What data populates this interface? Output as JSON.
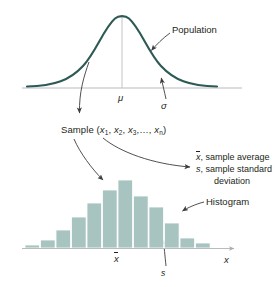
{
  "figure": {
    "title_alt": "Relationship between a population and a sample",
    "colors": {
      "curve": "#2d5a55",
      "bar_fill": "#a8c4c0",
      "bar_stroke": "#ffffff",
      "axis": "#b9bcbd",
      "arrow": "#3c3c3c",
      "text": "#231f20"
    }
  },
  "population": {
    "label": "Population",
    "axis": {
      "x_start": 22,
      "x_end": 242,
      "y": 88
    },
    "mu_label": "μ",
    "sigma_label": "σ",
    "mu_x": 122
  },
  "sample": {
    "text_prefix": "Sample (",
    "x1": "x",
    "x1_sub": "1",
    "x2": "x",
    "x2_sub": "2",
    "x3": "x",
    "x3_sub": "3",
    "ellipsis": ",…,",
    "xn": "x",
    "xn_sub": "n",
    "text_suffix": ")"
  },
  "statistics": {
    "line1_symbol": "x",
    "line1_text": ", sample average",
    "line2_symbol": "s",
    "line2_text": ", sample standard",
    "line3_text": "deviation"
  },
  "histogram": {
    "label": "Histogram",
    "axis_label": "x",
    "xbar_label": "x",
    "s_label": "s",
    "xbar_x": 118,
    "s_x": 164,
    "baseline_y": 248,
    "bar_left": 25,
    "bar_width": 14.6,
    "bar_gap": 0.9,
    "max_bar_height": 68
  },
  "chart_data": {
    "type": "bar",
    "title": "Histogram",
    "xlabel": "x",
    "ylabel": "",
    "categories": [
      "1",
      "2",
      "3",
      "4",
      "5",
      "6",
      "7",
      "8",
      "9",
      "10",
      "11",
      "12"
    ],
    "values": [
      3,
      8,
      18,
      31,
      45,
      58,
      68,
      52,
      41,
      25,
      10,
      5
    ],
    "ylim": [
      0,
      70
    ],
    "grid": false,
    "legend": null,
    "annotations": [
      {
        "text": "Histogram",
        "target_bar": 9
      },
      {
        "text": "x̄",
        "axis_position": 118
      },
      {
        "text": "s",
        "axis_position": 164
      }
    ]
  },
  "curve_data": {
    "type": "line",
    "description": "Normal (bell) density curve of the population",
    "mean_label": "μ",
    "sd_label": "σ",
    "peak_x": 122,
    "peak_y": 14,
    "baseline_y": 88
  },
  "arrows": [
    {
      "name": "population-pointer",
      "from": [
        170,
        32
      ],
      "to": [
        150,
        52
      ]
    },
    {
      "name": "sigma-pointer",
      "from": [
        166,
        98
      ],
      "to": [
        161,
        76
      ]
    },
    {
      "name": "curve-to-sample",
      "from": [
        89,
        62
      ],
      "to": [
        79,
        116
      ]
    },
    {
      "name": "sample-to-histogram",
      "from": [
        74,
        138
      ],
      "to": [
        105,
        182
      ]
    },
    {
      "name": "sample-to-statistics",
      "from": [
        103,
        137
      ],
      "to": [
        193,
        167
      ]
    },
    {
      "name": "histogram-pointer",
      "from": [
        204,
        201
      ],
      "to": [
        180,
        212
      ]
    },
    {
      "name": "s-pointer",
      "from": [
        166,
        266
      ],
      "to": [
        163,
        238
      ]
    }
  ]
}
